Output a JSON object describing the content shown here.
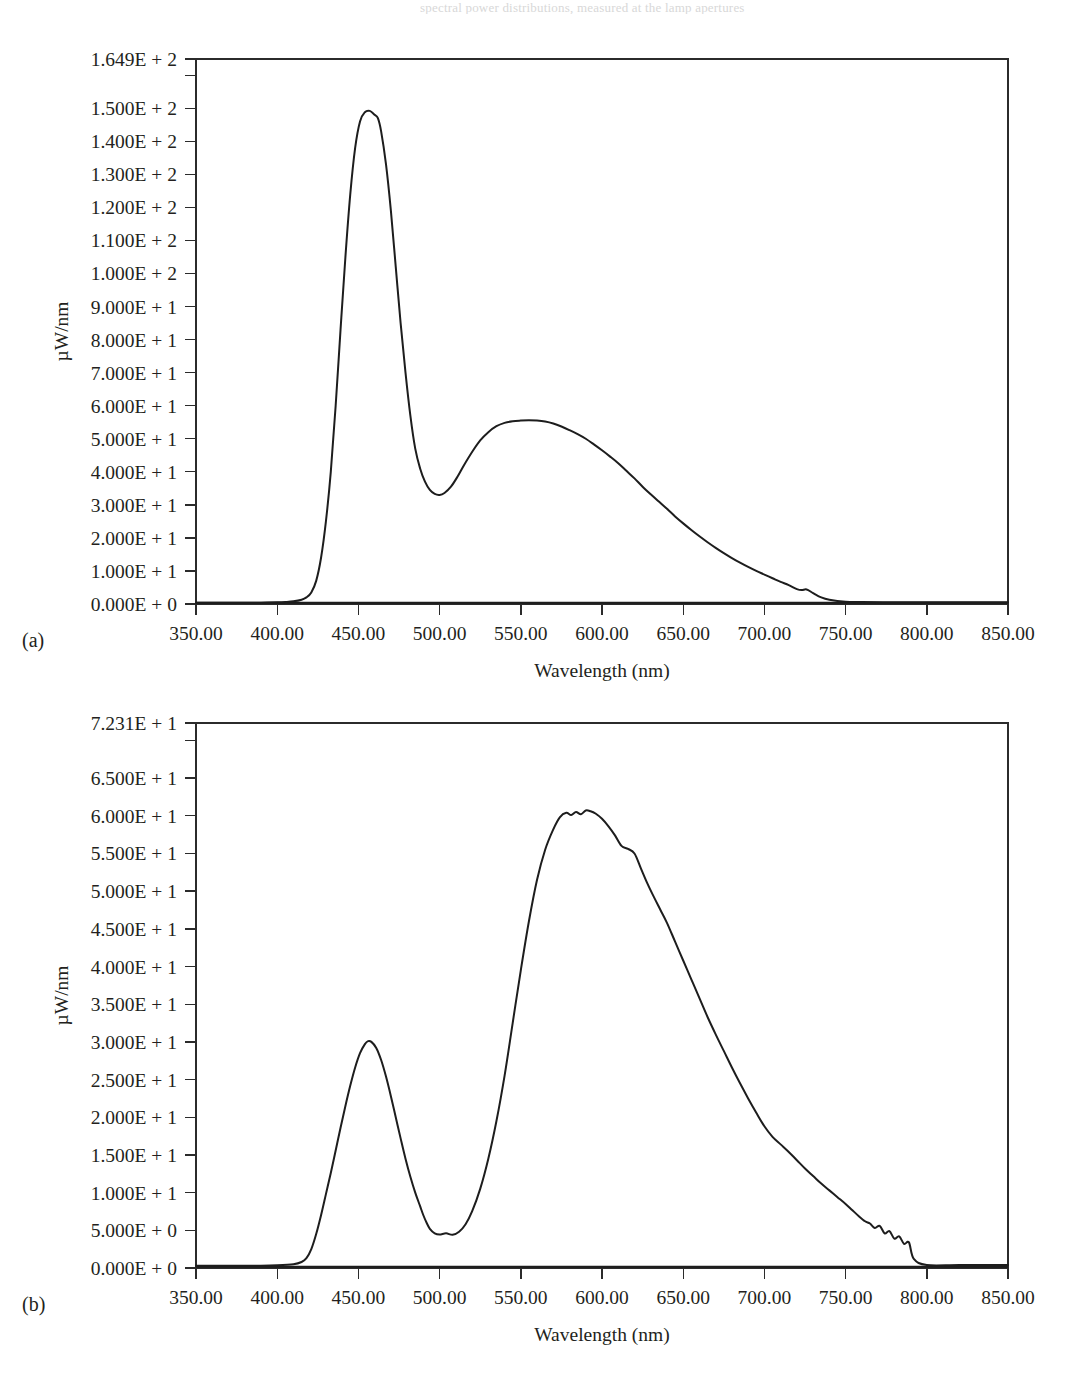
{
  "page": {
    "background": "#ffffff",
    "ink_color": "#231f20",
    "curve_color": "#1d1d1d",
    "top_cut_text": "spectral power distributions, measured at the lamp apertures",
    "bottom_cut_text": ""
  },
  "figure": {
    "panels": [
      {
        "id": "a",
        "sublabel": "(a)",
        "chart_ref": 0
      },
      {
        "id": "b",
        "sublabel": "(b)",
        "chart_ref": 1
      }
    ]
  },
  "chart_data": [
    {
      "type": "line",
      "panel": "(a)",
      "title": "",
      "xlabel": "Wavelength (nm)",
      "ylabel": "µW/nm",
      "xlim": [
        350.0,
        850.0
      ],
      "ylim": [
        0.0,
        164.9
      ],
      "grid": false,
      "legend": null,
      "xtick_labels": [
        "350.00",
        "400.00",
        "450.00",
        "500.00",
        "550.00",
        "600.00",
        "650.00",
        "700.00",
        "750.00",
        "800.00",
        "850.00"
      ],
      "xticks": [
        350,
        400,
        450,
        500,
        550,
        600,
        650,
        700,
        750,
        800,
        850
      ],
      "ytick_labels": [
        "1.649E + 2",
        "1.500E + 2",
        "1.400E + 2",
        "1.300E + 2",
        "1.200E + 2",
        "1.100E + 2",
        "1.000E + 2",
        "9.000E + 1",
        "8.000E + 1",
        "7.000E + 1",
        "6.000E + 1",
        "5.000E + 1",
        "4.000E + 1",
        "3.000E + 1",
        "2.000E + 1",
        "1.000E + 1",
        "0.000E + 0"
      ],
      "yticks": [
        164.9,
        150,
        140,
        130,
        120,
        110,
        100,
        90,
        80,
        70,
        60,
        50,
        40,
        30,
        20,
        10,
        0
      ],
      "y_minor_tick": 160.0,
      "series": [
        {
          "name": "spectral power",
          "x": [
            350,
            360,
            370,
            380,
            390,
            400,
            405,
            410,
            415,
            418,
            421,
            424,
            427,
            430,
            433,
            436,
            439,
            442,
            445,
            448,
            451,
            454,
            457,
            460,
            462,
            464,
            467,
            470,
            473,
            476,
            479,
            482,
            485,
            488,
            491,
            494,
            497,
            500,
            503,
            507,
            511,
            515,
            520,
            525,
            530,
            535,
            540,
            545,
            550,
            555,
            560,
            565,
            570,
            575,
            580,
            585,
            590,
            595,
            600,
            605,
            610,
            615,
            620,
            625,
            630,
            635,
            640,
            645,
            650,
            655,
            660,
            665,
            670,
            675,
            680,
            685,
            690,
            695,
            700,
            705,
            710,
            715,
            720,
            723,
            726,
            730,
            735,
            740,
            750,
            760,
            780,
            800,
            820,
            850
          ],
          "y": [
            0.4,
            0.4,
            0.4,
            0.4,
            0.4,
            0.5,
            0.6,
            0.8,
            1.3,
            2.0,
            3.5,
            7.0,
            14.0,
            25.0,
            40.0,
            60.0,
            83.0,
            105.0,
            124.0,
            138.0,
            146.0,
            148.8,
            149.2,
            148.0,
            147.0,
            143.0,
            133.0,
            119.0,
            102.0,
            85.0,
            70.0,
            57.0,
            47.0,
            41.0,
            37.0,
            34.5,
            33.3,
            33.0,
            33.6,
            35.5,
            38.5,
            42.0,
            46.0,
            49.5,
            52.0,
            53.8,
            54.8,
            55.3,
            55.5,
            55.6,
            55.5,
            55.2,
            54.6,
            53.7,
            52.6,
            51.4,
            50.0,
            48.3,
            46.5,
            44.6,
            42.6,
            40.3,
            38.0,
            35.5,
            33.2,
            31.0,
            28.8,
            26.5,
            24.4,
            22.4,
            20.5,
            18.7,
            17.0,
            15.4,
            13.9,
            12.5,
            11.2,
            10.0,
            8.9,
            7.8,
            6.7,
            5.7,
            4.5,
            4.2,
            4.4,
            3.3,
            2.0,
            1.3,
            0.7,
            0.6,
            0.5,
            0.5,
            0.5,
            0.5
          ]
        }
      ]
    },
    {
      "type": "line",
      "panel": "(b)",
      "title": "",
      "xlabel": "Wavelength (nm)",
      "ylabel": "µW/nm",
      "xlim": [
        350.0,
        850.0
      ],
      "ylim": [
        0.0,
        72.31
      ],
      "grid": false,
      "legend": null,
      "xtick_labels": [
        "350.00",
        "400.00",
        "450.00",
        "500.00",
        "550.00",
        "600.00",
        "650.00",
        "700.00",
        "750.00",
        "800.00",
        "850.00"
      ],
      "xticks": [
        350,
        400,
        450,
        500,
        550,
        600,
        650,
        700,
        750,
        800,
        850
      ],
      "ytick_labels": [
        "7.231E + 1",
        "6.500E + 1",
        "6.000E + 1",
        "5.500E + 1",
        "5.000E + 1",
        "4.500E + 1",
        "4.000E + 1",
        "3.500E + 1",
        "3.000E + 1",
        "2.500E + 1",
        "2.000E + 1",
        "1.500E + 1",
        "1.000E + 1",
        "5.000E + 0",
        "0.000E + 0"
      ],
      "yticks": [
        72.31,
        65,
        60,
        55,
        50,
        45,
        40,
        35,
        30,
        25,
        20,
        15,
        10,
        5,
        0
      ],
      "y_minor_tick": 70.0,
      "series": [
        {
          "name": "spectral power",
          "x": [
            350,
            370,
            390,
            400,
            410,
            415,
            418,
            421,
            424,
            427,
            430,
            433,
            436,
            439,
            442,
            445,
            448,
            451,
            454,
            456,
            458,
            461,
            464,
            467,
            470,
            473,
            476,
            479,
            482,
            485,
            488,
            490,
            492,
            494,
            497,
            500,
            504,
            508,
            512,
            516,
            520,
            525,
            530,
            535,
            540,
            545,
            550,
            555,
            560,
            565,
            570,
            574,
            578,
            581,
            584,
            587,
            590,
            593,
            596,
            600,
            604,
            608,
            612,
            616,
            620,
            624,
            628,
            632,
            636,
            640,
            645,
            650,
            655,
            660,
            665,
            670,
            675,
            680,
            685,
            690,
            695,
            700,
            705,
            710,
            715,
            720,
            725,
            730,
            735,
            740,
            745,
            750,
            754,
            758,
            762,
            765,
            768,
            771,
            774,
            777,
            780,
            783,
            786,
            789,
            792,
            800,
            820,
            850
          ],
          "y": [
            0.3,
            0.3,
            0.3,
            0.35,
            0.5,
            0.8,
            1.3,
            2.5,
            4.5,
            7.0,
            9.8,
            12.6,
            15.6,
            18.6,
            21.5,
            24.2,
            26.6,
            28.5,
            29.7,
            30.1,
            30.0,
            29.2,
            27.6,
            25.4,
            22.8,
            20.0,
            17.2,
            14.5,
            12.1,
            10.0,
            8.2,
            7.0,
            6.0,
            5.2,
            4.6,
            4.45,
            4.6,
            4.4,
            4.8,
            5.8,
            7.5,
            10.5,
            14.5,
            19.5,
            25.5,
            32.5,
            39.5,
            46.0,
            51.5,
            55.5,
            58.2,
            59.8,
            60.4,
            60.1,
            60.5,
            60.2,
            60.7,
            60.6,
            60.3,
            59.6,
            58.6,
            57.4,
            56.0,
            55.6,
            55.0,
            53.0,
            51.0,
            49.2,
            47.5,
            45.8,
            43.3,
            40.8,
            38.3,
            35.8,
            33.3,
            31.0,
            28.8,
            26.6,
            24.5,
            22.5,
            20.6,
            18.8,
            17.4,
            16.4,
            15.4,
            14.3,
            13.2,
            12.2,
            11.2,
            10.3,
            9.4,
            8.5,
            7.7,
            6.9,
            6.2,
            5.9,
            5.3,
            5.6,
            4.6,
            4.9,
            3.9,
            4.2,
            3.2,
            3.4,
            1.2,
            0.4,
            0.4,
            0.4
          ]
        }
      ]
    }
  ]
}
